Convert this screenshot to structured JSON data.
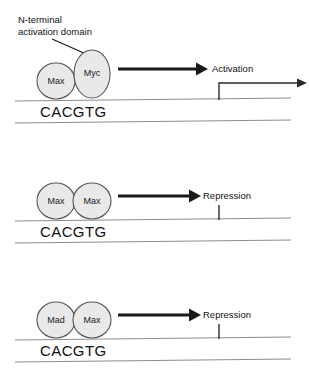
{
  "figure": {
    "annotation": {
      "line_1": "N-terminal",
      "line_2": "activation domain"
    },
    "panels": [
      {
        "id": "panel-activation",
        "dimer": [
          {
            "name": "Max",
            "shape": "circle"
          },
          {
            "name": "Myc",
            "shape": "ellipse-tall"
          }
        ],
        "outcome": "Activation",
        "motif": "CACGTG",
        "transcription": "start-arrow"
      },
      {
        "id": "panel-repression-max-max",
        "dimer": [
          {
            "name": "Max",
            "shape": "circle"
          },
          {
            "name": "Max",
            "shape": "circle"
          }
        ],
        "outcome": "Repression",
        "motif": "CACGTG",
        "transcription": "blocked-tick"
      },
      {
        "id": "panel-repression-mad-max",
        "dimer": [
          {
            "name": "Mad",
            "shape": "circle"
          },
          {
            "name": "Max",
            "shape": "circle"
          }
        ],
        "outcome": "Repression",
        "motif": "CACGTG",
        "transcription": "blocked-tick"
      }
    ],
    "colors": {
      "protein_fill": "#e9e9e9",
      "protein_stroke": "#555555",
      "dna_line": "#8d8d8d",
      "arrow": "#1a1a1a",
      "text": "#111111"
    }
  }
}
